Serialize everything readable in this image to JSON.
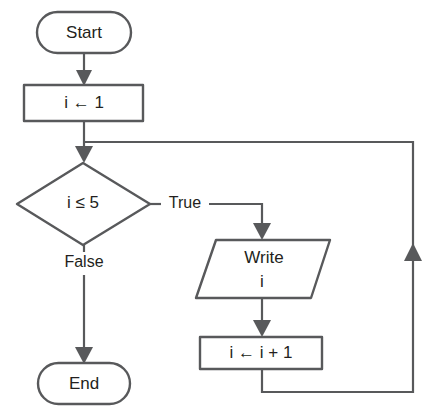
{
  "diagram": {
    "type": "flowchart",
    "colors": {
      "stroke": "#58595b",
      "text": "#231f20",
      "background": "#ffffff"
    },
    "nodes": [
      {
        "id": "start",
        "shape": "terminator",
        "label": "Start"
      },
      {
        "id": "init",
        "shape": "process",
        "label": "i ← 1"
      },
      {
        "id": "condition",
        "shape": "decision",
        "label": "i ≤ 5"
      },
      {
        "id": "write",
        "shape": "input-output",
        "label_line1": "Write",
        "label_line2": "i"
      },
      {
        "id": "increment",
        "shape": "process",
        "label": "i ← i + 1"
      },
      {
        "id": "end",
        "shape": "terminator",
        "label": "End"
      }
    ],
    "edge_labels": {
      "true_branch": "True",
      "false_branch": "False"
    }
  }
}
